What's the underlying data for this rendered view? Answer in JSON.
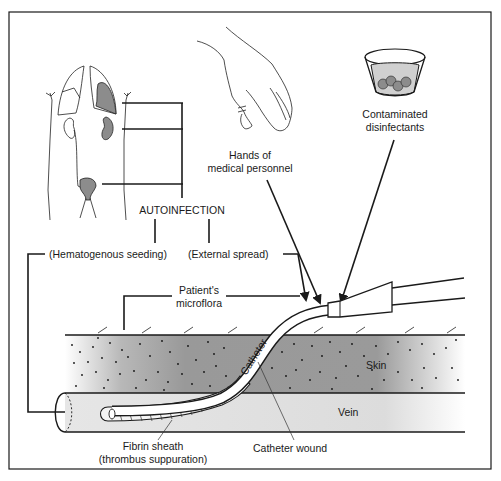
{
  "diagram": {
    "labels": {
      "autoinfection": "AUTOINFECTION",
      "hematogenous": "(Hematogenous seeding)",
      "external": "(External spread)",
      "hands_line1": "Hands of",
      "hands_line2": "medical personnel",
      "disinfectants_line1": "Contaminated",
      "disinfectants_line2": "disinfectants",
      "microflora_line1": "Patient's",
      "microflora_line2": "microflora",
      "catheter": "Catheter",
      "skin": "Skin",
      "vein": "Vein",
      "wound": "Catheter wound",
      "fibrin_line1": "Fibrin sheath",
      "fibrin_line2": "(thrombus suppuration)"
    },
    "elements": [
      {
        "name": "body-outline",
        "shaded_organs": [
          "left-lung",
          "kidney",
          "bladder"
        ]
      },
      {
        "name": "hand"
      },
      {
        "name": "cup-of-disinfectant"
      },
      {
        "name": "skin-layer"
      },
      {
        "name": "vein"
      },
      {
        "name": "catheter"
      },
      {
        "name": "catheter-hub"
      }
    ],
    "colors": {
      "line": "#1a1a1a",
      "skin": "#9a9a9a",
      "vein": "#dcdcdc",
      "organ": "#8c8c8c"
    }
  }
}
